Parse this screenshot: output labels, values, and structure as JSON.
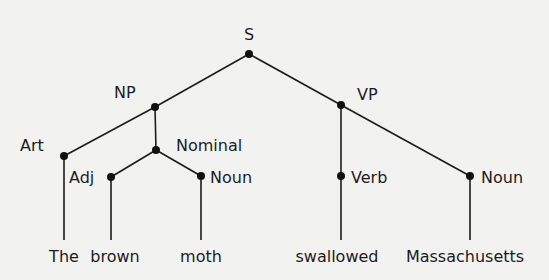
{
  "diagram": {
    "type": "parse-tree",
    "nodes": {
      "s": {
        "label": "S"
      },
      "np": {
        "label": "NP"
      },
      "vp": {
        "label": "VP"
      },
      "art": {
        "label": "Art"
      },
      "nominal": {
        "label": "Nominal"
      },
      "adj": {
        "label": "Adj"
      },
      "noun1": {
        "label": "Noun"
      },
      "verb": {
        "label": "Verb"
      },
      "noun2": {
        "label": "Noun"
      }
    },
    "words": [
      "The",
      "brown",
      "moth",
      "swallowed",
      "Massachusetts"
    ],
    "edges": [
      [
        "S",
        "NP"
      ],
      [
        "S",
        "VP"
      ],
      [
        "NP",
        "Art"
      ],
      [
        "NP",
        "Nominal"
      ],
      [
        "Nominal",
        "Adj"
      ],
      [
        "Nominal",
        "Noun"
      ],
      [
        "VP",
        "Verb"
      ],
      [
        "VP",
        "Noun"
      ],
      [
        "Art",
        "The"
      ],
      [
        "Adj",
        "brown"
      ],
      [
        "Noun",
        "moth"
      ],
      [
        "Verb",
        "swallowed"
      ],
      [
        "Noun",
        "Massachusetts"
      ]
    ]
  }
}
